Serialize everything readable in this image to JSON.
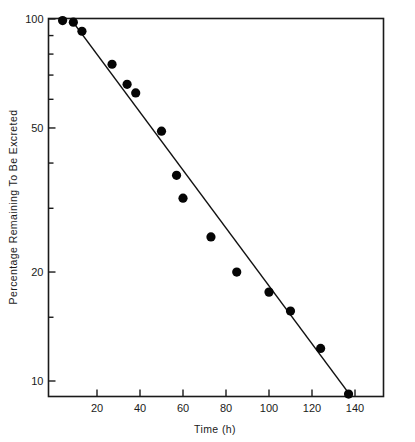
{
  "chart_data": {
    "type": "scatter",
    "title": "",
    "subtitle": "",
    "xlabel": "Time (h)",
    "ylabel": "Percentage Remaining To Be Excreted",
    "x_scale": "linear",
    "y_scale": "log",
    "xlim": [
      0,
      147
    ],
    "ylim": [
      8,
      105
    ],
    "grid": false,
    "legend": null,
    "legend_position": "none",
    "xticks": [
      20,
      40,
      60,
      80,
      100,
      120,
      140
    ],
    "xtick_labels": [
      "20",
      "40",
      "60",
      "80",
      "100",
      "120",
      "140"
    ],
    "yticks": [
      100,
      50,
      20,
      10
    ],
    "ytick_labels": [
      "100",
      "50",
      "20",
      "10"
    ],
    "y_minor_ticks": [
      90,
      80,
      70,
      60,
      40,
      30,
      15,
      9,
      8
    ],
    "marker": "filled-circle",
    "marker_color": "#050505",
    "line_color": "#111111",
    "points": [
      {
        "x": 4,
        "y": 99.0
      },
      {
        "x": 9,
        "y": 98.0
      },
      {
        "x": 13,
        "y": 92.5
      },
      {
        "x": 27,
        "y": 75.0
      },
      {
        "x": 34,
        "y": 66.0
      },
      {
        "x": 38,
        "y": 62.5
      },
      {
        "x": 50,
        "y": 49.0
      },
      {
        "x": 57,
        "y": 37.0
      },
      {
        "x": 60,
        "y": 32.0
      },
      {
        "x": 73,
        "y": 25.0
      },
      {
        "x": 85,
        "y": 20.0
      },
      {
        "x": 100,
        "y": 17.6
      },
      {
        "x": 110,
        "y": 15.6
      },
      {
        "x": 124,
        "y": 12.3
      },
      {
        "x": 137,
        "y": 9.2
      }
    ],
    "fit_line": {
      "type": "regression-line",
      "x_start": 10,
      "y_start": 96.0,
      "x_end": 138,
      "y_end": 9.1
    }
  },
  "axes": {
    "x_axis_label": "Time (h)",
    "y_axis_label": "Percentage Remaining To Be Excreted"
  }
}
